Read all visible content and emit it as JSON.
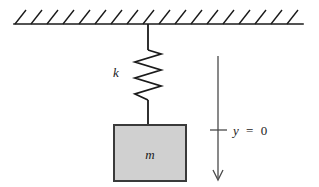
{
  "diagram": {
    "type": "physics-free-body-diagram",
    "labels": {
      "spring_constant": "k",
      "mass": "m",
      "axis_origin_variable": "y",
      "axis_origin_operator": "=",
      "axis_origin_value": "0",
      "axis_origin_full": "y = 0"
    },
    "colors": {
      "stroke": "#1a1a1a",
      "block_fill": "#d0d0d0",
      "block_stroke": "#3a3a3a",
      "background": "#ffffff",
      "axis_stroke": "#4a4a4a"
    },
    "geometry": {
      "ceiling": {
        "x1": 14,
        "x2": 303,
        "y": 24,
        "hatch_count": 18,
        "hatch_spacing": 16,
        "hatch_length": 15
      },
      "connector_top": {
        "x": 148,
        "y1": 24,
        "y2": 50
      },
      "spring": {
        "x_center": 148,
        "y_top": 50,
        "y_bottom": 100,
        "amplitude": 13,
        "coils": 6
      },
      "connector_bottom": {
        "x": 148,
        "y1": 100,
        "y2": 125
      },
      "block": {
        "x": 114,
        "y": 125,
        "width": 72,
        "height": 56
      },
      "axis_arrow": {
        "x": 218,
        "y_top": 56,
        "y_bottom": 180
      },
      "axis_tick": {
        "x1": 210,
        "x2": 227,
        "y": 130
      }
    }
  }
}
